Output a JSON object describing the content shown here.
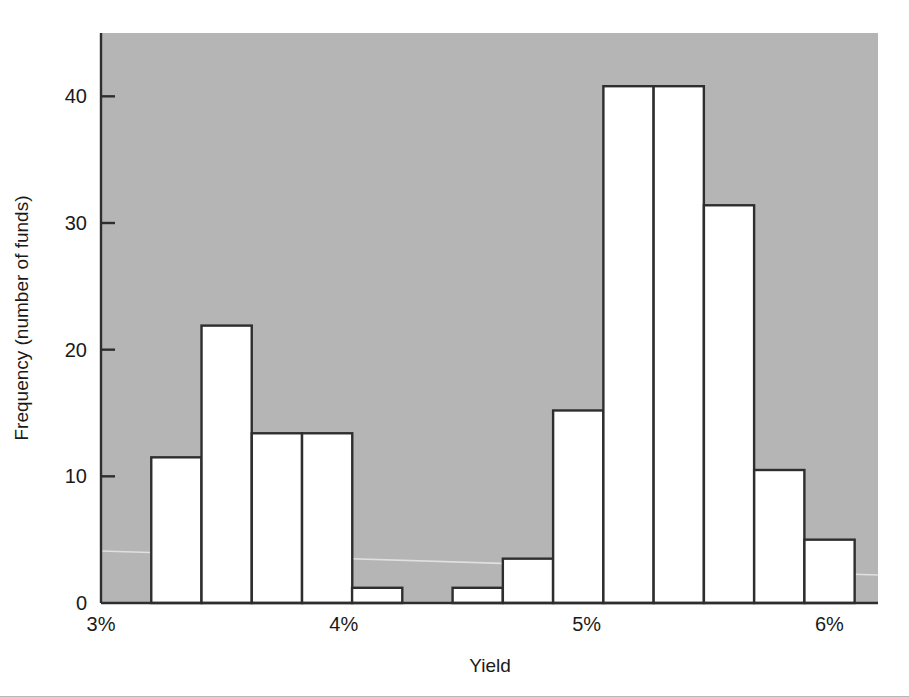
{
  "chart_data": {
    "type": "bar",
    "title": "",
    "subtitle": "",
    "xlabel": "Yield",
    "ylabel": "Frequency (number of funds)",
    "xlim": [
      3,
      6.2
    ],
    "ylim": [
      0,
      45
    ],
    "grid": false,
    "legend": null,
    "bin_width_percent": 0.2068,
    "x_tick_labels": [
      "3%",
      "4%",
      "5%",
      "6%"
    ],
    "x_tick_values": [
      3,
      4,
      5,
      6
    ],
    "y_tick_labels": [
      "0",
      "10",
      "20",
      "30",
      "40"
    ],
    "y_tick_values": [
      0,
      10,
      20,
      30,
      40
    ],
    "bin_starts": [
      3.207,
      3.414,
      3.621,
      3.828,
      4.034,
      4.241,
      4.448,
      4.655,
      4.862,
      5.069,
      5.276,
      5.483,
      5.69,
      5.897
    ],
    "values": [
      11.5,
      21.9,
      13.4,
      13.4,
      1.2,
      0,
      1.2,
      3.5,
      15.2,
      40.8,
      40.8,
      31.4,
      10.5,
      5.0
    ],
    "categories": [
      "3.21-3.41",
      "3.41-3.62",
      "3.62-3.83",
      "3.83-4.03",
      "4.03-4.24",
      "4.24-4.45",
      "4.45-4.66",
      "4.66-4.86",
      "4.86-5.07",
      "5.07-5.28",
      "5.28-5.48",
      "5.48-5.69",
      "5.69-5.90",
      "5.90-6.10"
    ],
    "colors": {
      "plot_background": "#b5b5b5",
      "bar_fill": "#ffffff",
      "bar_stroke": "#2e2e2e",
      "axis_line": "#2e2e2e",
      "text": "#1a1a1a",
      "page_background": "#ffffff"
    },
    "annotations": []
  }
}
